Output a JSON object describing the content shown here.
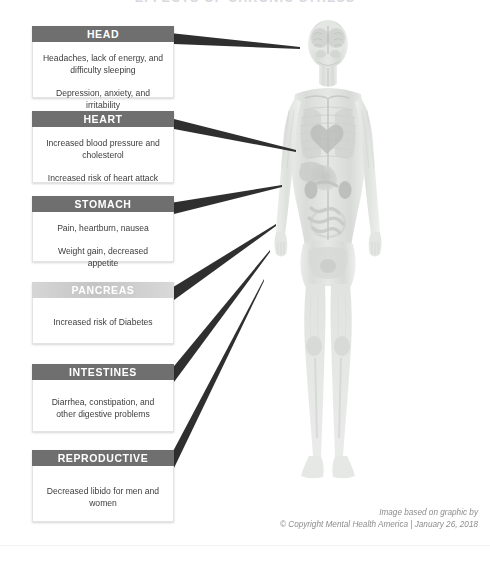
{
  "title": "EFFECTS OF CHRONIC STRESS",
  "colors": {
    "header_dark": "#6f6f6f",
    "header_light": "#cccccc",
    "connector": "#2b2b2b",
    "body_text": "#3c3c3c",
    "credit_text": "#8d8d8d"
  },
  "panels": [
    {
      "id": "head",
      "header": "HEAD",
      "lines": [
        "Headaches, lack of energy, and difficulty sleeping",
        "Depression, anxiety, and irritability"
      ]
    },
    {
      "id": "heart",
      "header": "HEART",
      "lines": [
        "Increased blood pressure and cholesterol",
        "Increased risk of heart attack"
      ]
    },
    {
      "id": "stomach",
      "header": "STOMACH",
      "lines": [
        "Pain, heartburn, nausea",
        "Weight gain, decreased appetite"
      ]
    },
    {
      "id": "pancreas",
      "header": "PANCREAS",
      "lines": [
        "Increased risk of Diabetes"
      ]
    },
    {
      "id": "intestines",
      "header": "INTESTINES",
      "lines": [
        "Diarrhea, constipation, and other digestive problems"
      ]
    },
    {
      "id": "reproductive",
      "header": "REPRODUCTIVE ORGANS",
      "lines": [
        "Decreased libido for men and women"
      ]
    }
  ],
  "figure": {
    "alt": "anatomical-body-illustration"
  },
  "credit": {
    "line1": "Image based on graphic by",
    "line2": "© Copyright Mental Health America | January 26, 2018"
  }
}
